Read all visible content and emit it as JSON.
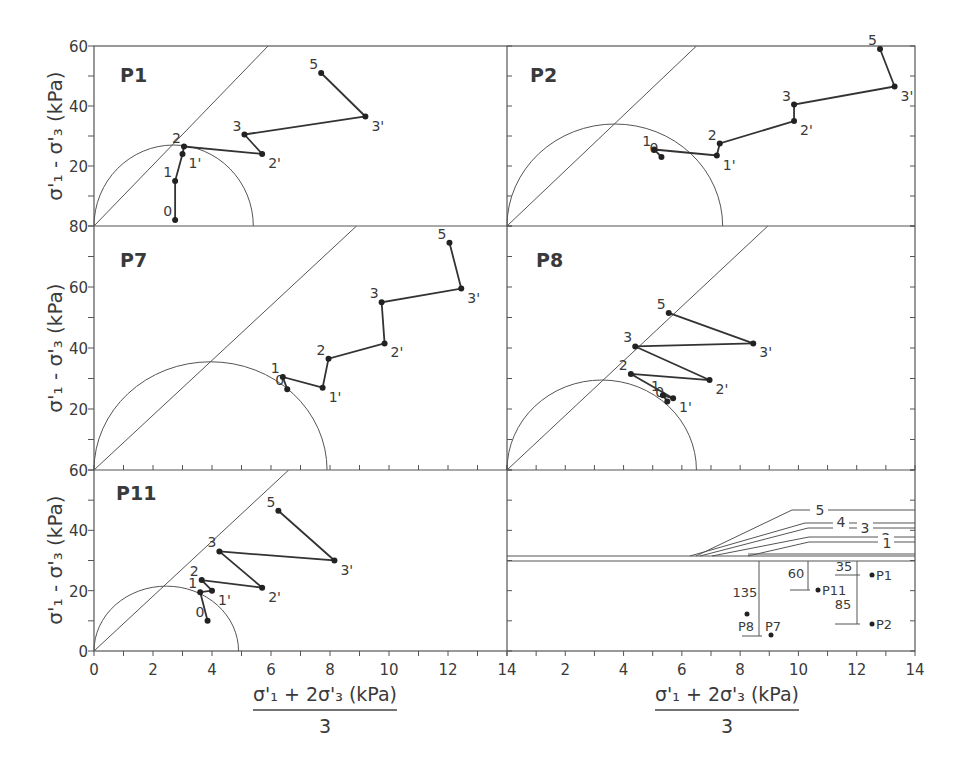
{
  "chart_data": [
    {
      "type": "line",
      "panel": "P1",
      "title": "P1",
      "ylabel": "σ'1 - σ'3 (kPa)",
      "xlabel": "",
      "xlim": [
        0,
        14
      ],
      "ylim": [
        0,
        60
      ],
      "yticks": [
        60,
        40,
        20
      ],
      "circle": {
        "center": 2.7,
        "radius": 2.7,
        "ytop": 27
      },
      "failure_line": {
        "from": [
          0,
          0
        ],
        "to": [
          5.9,
          60
        ]
      },
      "points": [
        {
          "label": "0",
          "x": 2.75,
          "y": 2
        },
        {
          "label": "1",
          "x": 2.75,
          "y": 15
        },
        {
          "label": "1'",
          "x": 3.0,
          "y": 24
        },
        {
          "label": "2",
          "x": 3.05,
          "y": 26.5
        },
        {
          "label": "2'",
          "x": 5.7,
          "y": 24
        },
        {
          "label": "3",
          "x": 5.1,
          "y": 30.5
        },
        {
          "label": "3'",
          "x": 9.2,
          "y": 36.5
        },
        {
          "label": "5",
          "x": 7.7,
          "y": 51
        }
      ]
    },
    {
      "type": "line",
      "panel": "P2",
      "title": "P2",
      "xlim": [
        0,
        14
      ],
      "ylim": [
        0,
        60
      ],
      "circle": {
        "center": 3.7,
        "radius": 3.7,
        "ytop": 34
      },
      "failure_line": {
        "from": [
          0,
          0
        ],
        "to": [
          6.5,
          60
        ]
      },
      "points": [
        {
          "label": "0",
          "x": 5.3,
          "y": 23
        },
        {
          "label": "1",
          "x": 5.05,
          "y": 25.5
        },
        {
          "label": "1'",
          "x": 7.2,
          "y": 23.5
        },
        {
          "label": "2",
          "x": 7.3,
          "y": 27.5
        },
        {
          "label": "2'",
          "x": 9.85,
          "y": 35
        },
        {
          "label": "3",
          "x": 9.85,
          "y": 40.5
        },
        {
          "label": "3'",
          "x": 13.3,
          "y": 46.5
        },
        {
          "label": "5",
          "x": 12.8,
          "y": 59
        }
      ]
    },
    {
      "type": "line",
      "panel": "P7",
      "title": "P7",
      "ylabel": "σ'1 - σ'3 (kPa)",
      "xlim": [
        0,
        14
      ],
      "ylim": [
        0,
        80
      ],
      "yticks": [
        80,
        60,
        40,
        20
      ],
      "circle": {
        "center": 3.95,
        "radius": 3.95,
        "ytop": 35.5
      },
      "failure_line": {
        "from": [
          0,
          0
        ],
        "to": [
          8.9,
          80
        ]
      },
      "points": [
        {
          "label": "0",
          "x": 6.55,
          "y": 26.5
        },
        {
          "label": "1",
          "x": 6.4,
          "y": 30.5
        },
        {
          "label": "1'",
          "x": 7.75,
          "y": 27
        },
        {
          "label": "2",
          "x": 7.95,
          "y": 36.5
        },
        {
          "label": "2'",
          "x": 9.85,
          "y": 41.5
        },
        {
          "label": "3",
          "x": 9.75,
          "y": 55
        },
        {
          "label": "3'",
          "x": 12.45,
          "y": 59.5
        },
        {
          "label": "5",
          "x": 12.05,
          "y": 74.5
        }
      ]
    },
    {
      "type": "line",
      "panel": "P8",
      "title": "P8",
      "xlim": [
        0,
        14
      ],
      "ylim": [
        0,
        80
      ],
      "circle": {
        "center": 3.25,
        "radius": 3.25,
        "ytop": 29.5
      },
      "failure_line": {
        "from": [
          0,
          0
        ],
        "to": [
          8.95,
          80
        ]
      },
      "points": [
        {
          "label": "0",
          "x": 5.5,
          "y": 22.5
        },
        {
          "label": "1",
          "x": 5.35,
          "y": 24.5
        },
        {
          "label": "1'",
          "x": 5.7,
          "y": 23.5
        },
        {
          "label": "2",
          "x": 4.25,
          "y": 31.5
        },
        {
          "label": "2'",
          "x": 6.95,
          "y": 29.5
        },
        {
          "label": "3",
          "x": 4.4,
          "y": 40.5
        },
        {
          "label": "3'",
          "x": 8.45,
          "y": 41.5
        },
        {
          "label": "5",
          "x": 5.55,
          "y": 51.5
        }
      ]
    },
    {
      "type": "line",
      "panel": "P11",
      "title": "P11",
      "ylabel": "σ'1 - σ'3 (kPa)",
      "xlabel": "(σ'1 + 2σ'3)/3 (kPa)",
      "xlim": [
        0,
        14
      ],
      "ylim": [
        0,
        60
      ],
      "yticks": [
        60,
        40,
        20,
        0
      ],
      "xticks": [
        0,
        2,
        4,
        6,
        8,
        10,
        12,
        14
      ],
      "circle": {
        "center": 2.45,
        "radius": 2.45,
        "ytop": 21.5
      },
      "failure_line": {
        "from": [
          0,
          0
        ],
        "to": [
          6.6,
          60
        ]
      },
      "points": [
        {
          "label": "0",
          "x": 3.85,
          "y": 10
        },
        {
          "label": "1",
          "x": 3.6,
          "y": 19.5
        },
        {
          "label": "1'",
          "x": 4.0,
          "y": 20
        },
        {
          "label": "2",
          "x": 3.65,
          "y": 23.5
        },
        {
          "label": "2'",
          "x": 5.7,
          "y": 21
        },
        {
          "label": "3",
          "x": 4.25,
          "y": 33
        },
        {
          "label": "3'",
          "x": 8.15,
          "y": 30
        },
        {
          "label": "5",
          "x": 6.25,
          "y": 46.5
        }
      ]
    },
    {
      "type": "diagram",
      "panel": "profile",
      "title": "Sampling depth profile",
      "xlabel": "(σ'1 + 2σ'3)/3 (kPa)",
      "xticks": [
        14,
        2,
        4,
        6,
        8,
        10,
        12,
        14
      ],
      "layers": [
        "1",
        "2",
        "3",
        "4",
        "5"
      ],
      "depth_labels": [
        "135",
        "60",
        "35",
        "85"
      ],
      "points": [
        {
          "label": "P1",
          "x": 12.5
        },
        {
          "label": "P11",
          "x": 10.6
        },
        {
          "label": "P2",
          "x": 12.5
        },
        {
          "label": "P8",
          "x": 8.1
        },
        {
          "label": "P7",
          "x": 9.0
        }
      ]
    }
  ],
  "labels": {
    "ylabel_top": "σ'₁ - σ'₃ (kPa)",
    "ylabel_mid": "σ'₁ - σ'₃ (kPa)",
    "ylabel_bot": "σ'₁ - σ'₃ (kPa)",
    "xlabel_num": "σ'₁ + 2σ'₃ (kPa)",
    "xlabel_den": "3",
    "panel_P1": "P1",
    "panel_P2": "P2",
    "panel_P7": "P7",
    "panel_P8": "P8",
    "panel_P11": "P11",
    "yt": {
      "r1": [
        "60",
        "40",
        "20"
      ],
      "r2": [
        "80",
        "60",
        "40",
        "20"
      ],
      "r3": [
        "60",
        "40",
        "20",
        "0"
      ]
    },
    "xt_left": [
      "0",
      "2",
      "4",
      "6",
      "8",
      "10",
      "12",
      "14"
    ],
    "xt_right": [
      "2",
      "4",
      "6",
      "8",
      "10",
      "12",
      "14"
    ],
    "layers": {
      "l1": "1",
      "l2": "2",
      "l3": "3",
      "l4": "4",
      "l5": "5"
    },
    "depths": {
      "d135": "135",
      "d60": "60",
      "d35": "35",
      "d85": "85"
    },
    "sites": {
      "P1": "P1",
      "P11": "P11",
      "P2": "P2",
      "P8": "P8",
      "P7": "P7"
    }
  }
}
